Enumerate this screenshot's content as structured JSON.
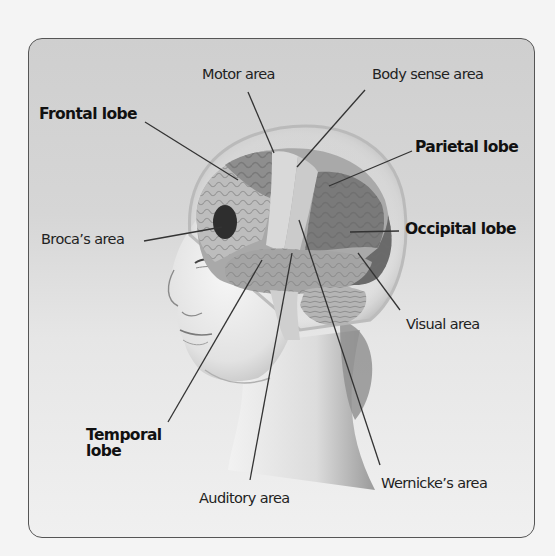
{
  "figure": {
    "background_color": "#d4d4d4",
    "frame_color": "#555555"
  },
  "labels": {
    "motor_area": "Motor area",
    "body_sense_area": "Body sense area",
    "frontal_lobe": "Frontal lobe",
    "parietal_lobe": "Parietal lobe",
    "brocas_area": "Broca’s area",
    "occipital_lobe": "Occipital lobe",
    "visual_area": "Visual area",
    "temporal_lobe_line1": "Temporal",
    "temporal_lobe_line2": "lobe",
    "auditory_area": "Auditory area",
    "wernickes_area": "Wernicke’s area"
  },
  "lobes_bold": [
    "Frontal lobe",
    "Parietal lobe",
    "Occipital lobe",
    "Temporal lobe"
  ],
  "areas_plain": [
    "Motor area",
    "Body sense area",
    "Broca’s area",
    "Visual area",
    "Auditory area",
    "Wernicke’s area"
  ]
}
